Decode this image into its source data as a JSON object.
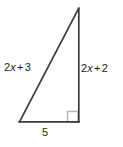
{
  "diagram": {
    "type": "right-triangle",
    "background_color": "#ffffff",
    "stroke_color": "#3a3a3a",
    "right_angle_marker_color": "#b5b5b5",
    "text_color": "#231f20",
    "vertices": {
      "apex": [
        79,
        8
      ],
      "bottom_left": [
        19,
        122
      ],
      "bottom_right": [
        79,
        122
      ]
    },
    "right_angle_marker": {
      "at_vertex": "bottom_right",
      "x": 67,
      "y": 111,
      "size": 11
    },
    "labels": {
      "hypotenuse": {
        "name": "2x + 3",
        "coefficient": "2",
        "variable": "x",
        "operator": "+",
        "constant": "3"
      },
      "vertical_leg": {
        "name": "2x + 2",
        "coefficient": "2",
        "variable": "x",
        "operator": "+",
        "constant": "2"
      },
      "base": {
        "name": "5",
        "value": "5"
      }
    }
  }
}
